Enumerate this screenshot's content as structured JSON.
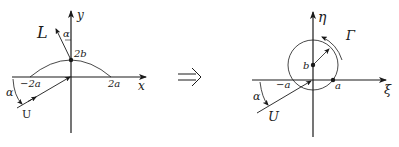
{
  "left_figure": {
    "axis_x_label": "x",
    "axis_y_label": "y",
    "tick_neg": "−2a",
    "tick_pos": "2a",
    "point_label": "2b",
    "lift_label": "L",
    "angle_label_top": "α",
    "angle_label_left": "α",
    "velocity_label": "U"
  },
  "arrow": {
    "symbol": "⟹"
  },
  "right_figure": {
    "axis_x_label": "ξ",
    "axis_y_label": "η",
    "tick_neg": "−a",
    "tick_pos": "a",
    "center_label": "b",
    "circulation_label": "Γ",
    "angle_label": "α",
    "velocity_label": "U"
  }
}
